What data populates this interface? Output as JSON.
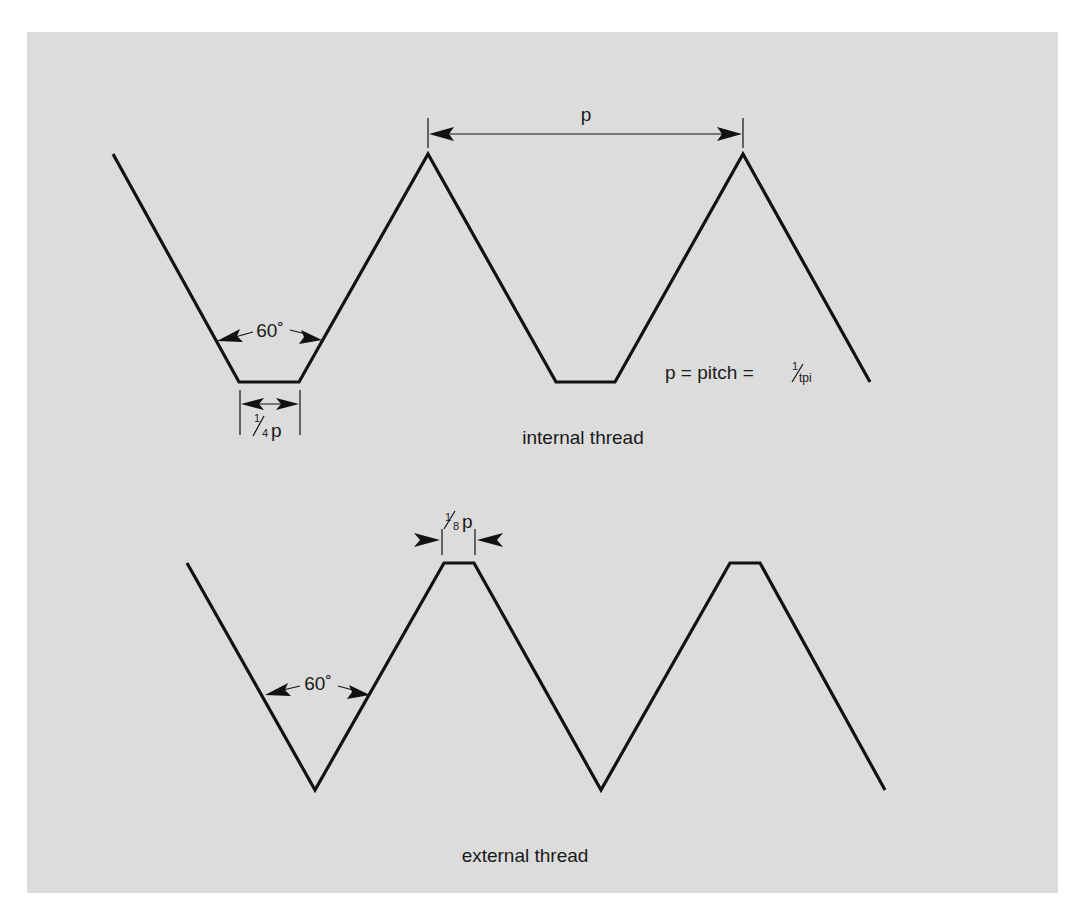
{
  "diagram": {
    "type": "screw-thread-profile",
    "colors": {
      "background": "#dcdcdc",
      "page": "#ffffff",
      "line": "#111111"
    },
    "internal_thread": {
      "caption": "internal thread",
      "angle_label": "60˚",
      "root_width_label_num": "1",
      "root_width_label_den": "4",
      "root_width_label_var": "p",
      "pitch_label": "p",
      "formula": {
        "lhs": "p = pitch = ",
        "frac_num": "1",
        "frac_den": "tpi"
      }
    },
    "external_thread": {
      "caption": "external thread",
      "angle_label": "60˚",
      "crest_width_label_num": "1",
      "crest_width_label_den": "8",
      "crest_width_label_var": "p"
    }
  }
}
